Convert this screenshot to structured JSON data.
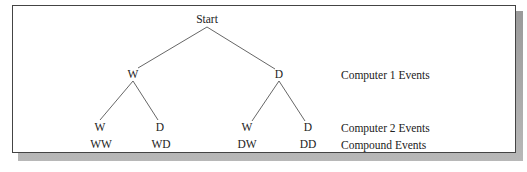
{
  "diagram": {
    "type": "tree-diagram",
    "root": {
      "label": "Start",
      "children": [
        {
          "label": "W",
          "children": [
            {
              "label": "W",
              "compound": "WW"
            },
            {
              "label": "D",
              "compound": "WD"
            }
          ]
        },
        {
          "label": "D",
          "children": [
            {
              "label": "W",
              "compound": "DW"
            },
            {
              "label": "D",
              "compound": "DD"
            }
          ]
        }
      ]
    },
    "level_labels": {
      "level1": "Computer 1 Events",
      "level2": "Computer 2 Events",
      "compound": "Compound Events"
    }
  },
  "nodes": {
    "start": "Start",
    "l1_w": "W",
    "l1_d": "D",
    "l2_ww": "W",
    "l2_wd": "D",
    "l2_dw": "W",
    "l2_dd": "D",
    "c_ww": "WW",
    "c_wd": "WD",
    "c_dw": "DW",
    "c_dd": "DD"
  },
  "labels": {
    "computer1": "Computer 1 Events",
    "computer2": "Computer 2 Events",
    "compound": "Compound Events"
  }
}
